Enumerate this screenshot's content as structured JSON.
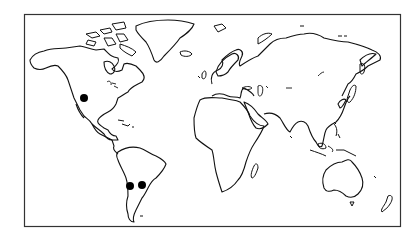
{
  "map": {
    "type": "world-outline",
    "projection": "equirectangular-like",
    "frame": {
      "x": 24,
      "y": 14,
      "width": 377,
      "height": 213,
      "stroke": "#333333"
    },
    "background": "#ffffff",
    "outline_color": "#111111",
    "markers": [
      {
        "id": "marker-north-america",
        "region": "southwestern United States",
        "x": 84,
        "y": 98,
        "r": 4,
        "color": "#000000"
      },
      {
        "id": "marker-south-america-west",
        "region": "central Argentina / Chile",
        "x": 130,
        "y": 186,
        "r": 4,
        "color": "#000000"
      },
      {
        "id": "marker-south-america-east",
        "region": "northeastern Argentina",
        "x": 142,
        "y": 185,
        "r": 4,
        "color": "#000000"
      }
    ]
  }
}
